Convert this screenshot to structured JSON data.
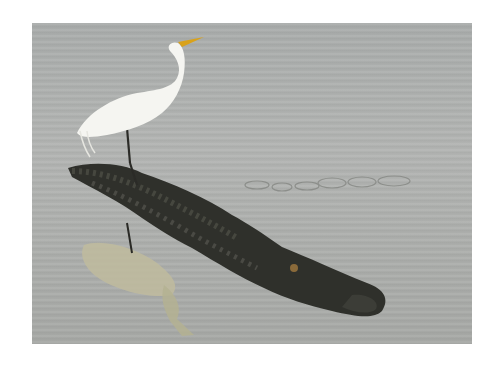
{
  "image": {
    "description": "Great egret standing on the back of an alligator swimming in calm grey water, with the egret's reflection below",
    "subjects": [
      "egret",
      "alligator",
      "reflection",
      "water"
    ],
    "colors": {
      "background": "#ffffff",
      "water": "#aaacaa",
      "egret": "#f4f4f0",
      "beak": "#d9a21a",
      "alligator": "#2e2f2a",
      "reflection": "#b9b69a"
    }
  }
}
